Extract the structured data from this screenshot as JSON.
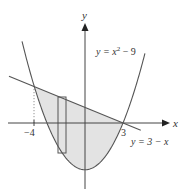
{
  "figure": {
    "type": "area-between-curves",
    "axes": {
      "x_label": "x",
      "y_label": "y",
      "origin_px": [
        85,
        123
      ],
      "scale_px_per_unit": {
        "x": 12.67,
        "y": 5.2
      }
    },
    "curves": [
      {
        "name": "parabola",
        "equation": "y = x^2 - 9",
        "label_main": "y = x",
        "label_sup": "2",
        "label_tail": " − 9"
      },
      {
        "name": "line",
        "equation": "y = 3 - x",
        "label": "y = 3 − x"
      }
    ],
    "tick_labels": {
      "left_intersection": "−4",
      "right_intersection": "3"
    },
    "intersections": [
      [
        -4,
        7
      ],
      [
        3,
        0
      ]
    ],
    "shaded_region": "between y = 3 - x (top) and y = x^2 - 9 (bottom), from x = -4 to x = 3",
    "representative_rectangle": {
      "x_range": [
        -2.1,
        -1.5
      ],
      "description": "vertical strip from parabola up to line"
    },
    "colors": {
      "stroke": "#555555",
      "fill": "#e3e3e3",
      "text": "#333333"
    }
  }
}
